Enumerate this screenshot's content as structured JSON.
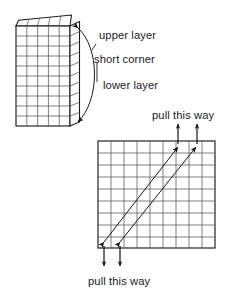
{
  "figure": {
    "type": "line-diagram",
    "background_color": "#ffffff",
    "stroke_color": "#1a1a1a",
    "grid_line_color": "#555555"
  },
  "labels": {
    "upper_layer": "upper layer",
    "short_corner": "short corner",
    "lower_layer": "lower layer",
    "pull_this_way_top": "pull this way",
    "pull_this_way_bottom": "pull this way"
  },
  "top_figure": {
    "name": "folded-sheet",
    "main_panel": {
      "columns": 5,
      "rows": 10,
      "left": 16,
      "top": 26,
      "right": 70,
      "bottom": 126
    },
    "fold_strip": {
      "columns": 1,
      "rows": 10,
      "left": 70,
      "right": 80,
      "top": 26,
      "bottom": 126
    },
    "upper_flap": {
      "columns": 5,
      "skew_top_left_y": 20,
      "skew_top_right_y": 15
    },
    "callout": {
      "type": "curved-double-arrow",
      "from": "upper layer corner",
      "to": "lower layer corner"
    }
  },
  "bottom_figure": {
    "name": "sheared-grid",
    "grid": {
      "columns": 9,
      "rows": 9,
      "left": 98,
      "top": 141,
      "right": 215,
      "bottom": 248
    },
    "pull_arrows": {
      "count": 2,
      "top_direction": "up",
      "bottom_direction": "down",
      "diagonal_count": 2,
      "diagonal_direction": "bidirectional lower-left to upper-right"
    }
  }
}
